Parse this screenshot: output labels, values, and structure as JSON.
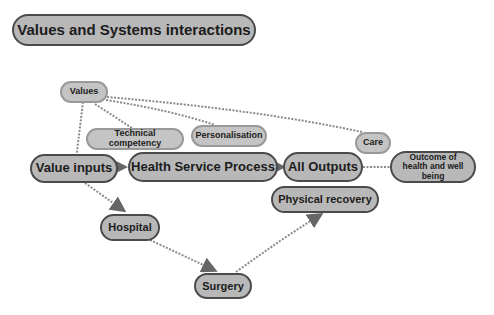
{
  "title": "Values and Systems interactions",
  "nodes": {
    "values": "Values",
    "technical": "Technical competency",
    "personalisation": "Personalisation",
    "care": "Care",
    "value_inputs": "Value inputs",
    "health_service": "Health Service Process",
    "all_outputs": "All Outputs",
    "outcome": "Outcome of health and well being",
    "hospital": "Hospital",
    "surgery": "Surgery",
    "physical_recovery": "Physical recovery"
  },
  "colors": {
    "node_fill": "#bdbdbd",
    "dark_border": "#4a4a4a",
    "light_border": "#999999",
    "connector": "#8a8a8a"
  }
}
